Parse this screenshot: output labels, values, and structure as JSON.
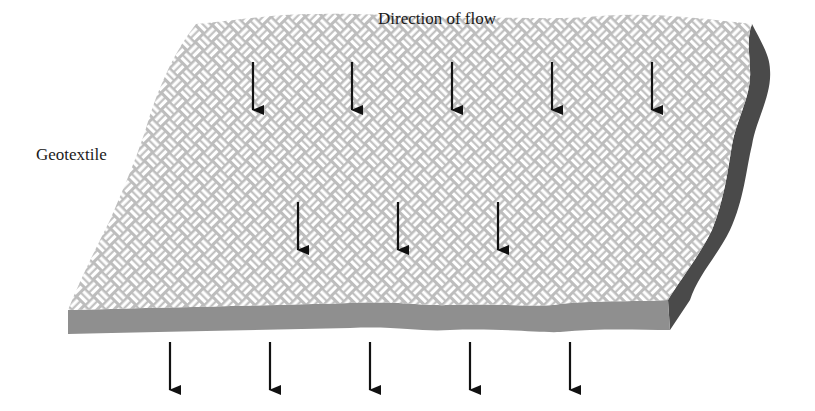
{
  "labels": {
    "flow": "Direction of flow",
    "material": "Geotextile"
  },
  "colors": {
    "weave_background": "#bdbdbd",
    "weave_strands": "#ffffff",
    "front_edge": "#8f8f8f",
    "side_edge": "#4a4a4a",
    "arrow": "#111111"
  },
  "arrows": {
    "top_row_x": [
      253,
      352,
      452,
      552,
      652
    ],
    "middle_row_x": [
      298,
      398,
      498
    ],
    "bottom_row_x": [
      170,
      270,
      370,
      470,
      570
    ]
  }
}
